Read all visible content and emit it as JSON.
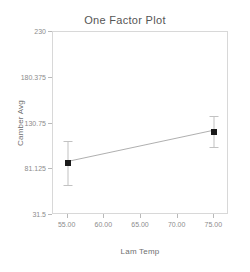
{
  "chart_data": {
    "type": "line",
    "title": "One Factor Plot",
    "xlabel": "Lam Temp",
    "ylabel": "Camber Avg",
    "x": [
      55,
      75
    ],
    "values": [
      88,
      122
    ],
    "error_low": [
      64,
      105
    ],
    "error_high": [
      112,
      139
    ],
    "xlim": [
      53,
      77
    ],
    "ylim": [
      31.5,
      230
    ],
    "xticks": [
      55,
      60,
      65,
      70,
      75
    ],
    "xtick_labels": [
      "55.00",
      "60.00",
      "65.00",
      "70.00",
      "75.00"
    ],
    "yticks": [
      31.5,
      81.125,
      130.75,
      180.375,
      230
    ],
    "ytick_labels": [
      "31.5",
      "81.125",
      "130.75",
      "180.375",
      "230"
    ],
    "grid": false,
    "legend": "none",
    "series": [
      {
        "name": "Camber Avg",
        "x": [
          55,
          75
        ],
        "values": [
          88,
          122
        ],
        "error_low": [
          64,
          105
        ],
        "error_high": [
          112,
          139
        ],
        "marker": "filled-square",
        "marker_color": "#1a1a1a",
        "line_color": "#9a9a9a"
      }
    ]
  },
  "style": {
    "background": "#ffffff",
    "axis_color": "#d8d8d8",
    "tick_color": "#b9b9b9",
    "text_color": "#8c8c8c",
    "title_color": "#555555",
    "marker_color": "#1a1a1a",
    "line_color": "#9a9a9a",
    "error_color": "#c2c2c2"
  }
}
